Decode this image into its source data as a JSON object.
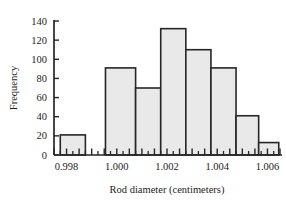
{
  "chart_data": {
    "type": "bar",
    "title": "",
    "subtitle": "",
    "xlabel": "Rod diameter (centimeters)",
    "ylabel": "Frequency",
    "grid": false,
    "legend": null,
    "legend_position": "none",
    "ylim": [
      0,
      140
    ],
    "xlim": [
      0.9975,
      1.0065
    ],
    "yticks": [
      0,
      20,
      40,
      60,
      80,
      100,
      120,
      140
    ],
    "ytick_labels": [
      "0",
      "20",
      "40",
      "60",
      "80",
      "100",
      "120",
      "140"
    ],
    "xticks": [
      0.998,
      1.0,
      1.002,
      1.004,
      1.006
    ],
    "xtick_labels": [
      "0.998",
      "1.000",
      "1.002",
      "1.004",
      "1.006"
    ],
    "bin_width": 0.0005,
    "bin_edges": [
      0.9975,
      0.998,
      0.9985,
      0.999,
      0.9995,
      1.0,
      1.0005,
      1.001,
      1.0015,
      1.002,
      1.0025,
      1.003,
      1.0035,
      1.004,
      1.0045,
      1.005,
      1.0055,
      1.006,
      1.0065
    ],
    "categories": [
      "0.9975-0.9985",
      "0.9995-1.0005",
      "1.0005-1.0015",
      "1.0015-1.0025",
      "1.0025-1.0035",
      "1.0035-1.0045",
      "1.0045-1.0055",
      "1.0055-1.0065"
    ],
    "bars": [
      {
        "left": 0.99775,
        "right": 0.99875,
        "value": 21
      },
      {
        "left": 0.99955,
        "right": 1.00075,
        "value": 91
      },
      {
        "left": 1.00075,
        "right": 1.00175,
        "value": 70
      },
      {
        "left": 1.00175,
        "right": 1.00275,
        "value": 132
      },
      {
        "left": 1.00275,
        "right": 1.00375,
        "value": 110
      },
      {
        "left": 1.00375,
        "right": 1.00475,
        "value": 91
      },
      {
        "left": 1.00475,
        "right": 1.00565,
        "value": 41
      },
      {
        "left": 1.00565,
        "right": 1.00645,
        "value": 13
      }
    ],
    "values": [
      21,
      91,
      70,
      132,
      110,
      91,
      41,
      13
    ],
    "colors": {
      "bar_fill": "#e9e9e9",
      "bar_stroke": "#262626",
      "axis": "#262626",
      "text": "#1c1c1c",
      "background": "#ffffff"
    }
  }
}
